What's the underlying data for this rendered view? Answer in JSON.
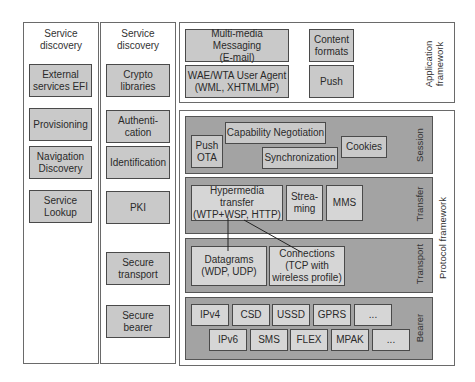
{
  "diagram": {
    "columns": [
      {
        "title": "Service discovery",
        "title_lines": [
          "Service",
          "discovery"
        ],
        "items": [
          {
            "lines": [
              "External",
              "services EFI"
            ]
          },
          {
            "lines": [
              "Provisioning"
            ]
          },
          {
            "lines": [
              "Navigation",
              "Discovery"
            ]
          },
          {
            "lines": [
              "Service",
              "Lookup"
            ]
          }
        ]
      },
      {
        "title": "Service discovery",
        "title_lines": [
          "Service",
          "discovery"
        ],
        "items": [
          {
            "lines": [
              "Crypto",
              "libraries"
            ]
          },
          {
            "lines": [
              "Authenti-",
              "cation"
            ]
          },
          {
            "lines": [
              "Identification"
            ]
          },
          {
            "lines": [
              "PKI"
            ]
          },
          {
            "lines": [
              "Secure",
              "transport"
            ]
          },
          {
            "lines": [
              "Secure",
              "bearer"
            ]
          }
        ]
      }
    ],
    "application_framework": {
      "label_lines": [
        "Application",
        "framework"
      ],
      "items": [
        {
          "lines": [
            "Multi-media Messaging",
            "(E-mail)"
          ]
        },
        {
          "lines": [
            "WAE/WTA User Agent",
            "(WML, XHTMLMP)"
          ]
        },
        {
          "lines": [
            "Content",
            "formats"
          ]
        },
        {
          "lines": [
            "Push"
          ]
        }
      ]
    },
    "protocol_framework": {
      "label": "Protocol framework",
      "layers": {
        "session": {
          "label": "Session",
          "items": [
            {
              "lines": [
                "Push",
                "OTA"
              ]
            },
            {
              "lines": [
                "Capability Negotiation"
              ]
            },
            {
              "lines": [
                "Synchronization"
              ]
            },
            {
              "lines": [
                "Cookies"
              ]
            }
          ]
        },
        "transfer": {
          "label": "Transfer",
          "items": [
            {
              "lines": [
                "Hypermedia transfer",
                "(WTP+WSP, HTTP)"
              ]
            },
            {
              "lines": [
                "Strea-",
                "ming"
              ]
            },
            {
              "lines": [
                "MMS"
              ]
            }
          ]
        },
        "transport": {
          "label": "Transport",
          "items": [
            {
              "lines": [
                "Datagrams",
                "(WDP, UDP)"
              ]
            },
            {
              "lines": [
                "Connections",
                "(TCP with",
                "wireless profile)"
              ]
            }
          ]
        },
        "bearer": {
          "label": "Bearer",
          "row1": [
            "IPv4",
            "CSD",
            "USSD",
            "GPRS",
            "..."
          ],
          "row2": [
            "IPv6",
            "SMS",
            "FLEX",
            "MPAK",
            "..."
          ]
        }
      }
    },
    "colors": {
      "box_fill": "#c9c9c9",
      "band_fill": "#a3a3a3",
      "border": "#4a4a4a",
      "background": "#ffffff"
    }
  }
}
